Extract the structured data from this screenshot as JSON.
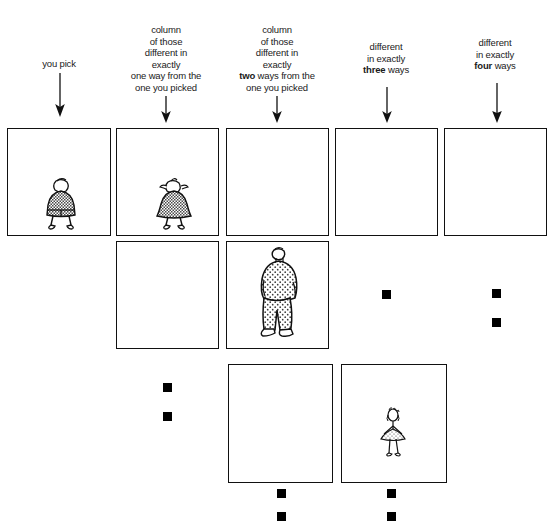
{
  "page": {
    "background_color": "#ffffff",
    "ink_color": "#111111",
    "marker_color": "#000000"
  },
  "columns": [
    {
      "id": "col-1",
      "index": 1,
      "caption_lines": [
        "you pick"
      ],
      "bold_word": "",
      "arrow": true
    },
    {
      "id": "col-2",
      "index": 2,
      "caption_lines": [
        "column",
        "of those",
        "different in",
        "exactly",
        "one way from the",
        "one you picked"
      ],
      "bold_word": "",
      "arrow": true
    },
    {
      "id": "col-3",
      "index": 3,
      "caption_lines": [
        "column",
        "of those",
        "different in",
        "exactly",
        "two ways from the",
        "one you picked"
      ],
      "bold_word": "two",
      "arrow": true
    },
    {
      "id": "col-4",
      "index": 4,
      "caption_lines": [
        "different",
        "in exactly",
        "three ways"
      ],
      "bold_word": "three",
      "arrow": true
    },
    {
      "id": "col-5",
      "index": 5,
      "caption_lines": [
        "different",
        "in exactly",
        "four ways"
      ],
      "bold_word": "four",
      "arrow": true
    }
  ],
  "grid": {
    "rows": [
      {
        "row": 1,
        "cells": [
          {
            "column": 1,
            "type": "box",
            "figure": "stout-figure-shorts",
            "markers": 0
          },
          {
            "column": 2,
            "type": "box",
            "figure": "stout-figure-skirt-pigtails",
            "markers": 0
          },
          {
            "column": 3,
            "type": "box",
            "figure": "",
            "markers": 0
          },
          {
            "column": 4,
            "type": "box",
            "figure": "",
            "markers": 0
          },
          {
            "column": 5,
            "type": "box",
            "figure": "",
            "markers": 0
          }
        ]
      },
      {
        "row": 2,
        "cells": [
          {
            "column": 1,
            "type": "empty",
            "figure": "",
            "markers": 0
          },
          {
            "column": 2,
            "type": "box",
            "figure": "",
            "markers": 0
          },
          {
            "column": 3,
            "type": "box",
            "figure": "tall-figure-stippled",
            "markers": 0
          },
          {
            "column": 4,
            "type": "markers",
            "figure": "",
            "markers": 1
          },
          {
            "column": 5,
            "type": "markers",
            "figure": "",
            "markers": 2
          }
        ]
      },
      {
        "row": 3,
        "cells": [
          {
            "column": 1,
            "type": "empty",
            "figure": "",
            "markers": 0
          },
          {
            "column": 2,
            "type": "markers",
            "figure": "",
            "markers": 2
          },
          {
            "column": 3,
            "type": "box",
            "figure": "",
            "markers": 0
          },
          {
            "column": 4,
            "type": "box",
            "figure": "thin-figure-skirt",
            "markers": 0
          },
          {
            "column": 5,
            "type": "empty",
            "figure": "",
            "markers": 0
          }
        ]
      },
      {
        "row": 4,
        "cells": [
          {
            "column": 1,
            "type": "empty",
            "figure": "",
            "markers": 0
          },
          {
            "column": 2,
            "type": "empty",
            "figure": "",
            "markers": 0
          },
          {
            "column": 3,
            "type": "markers",
            "figure": "",
            "markers": 2
          },
          {
            "column": 4,
            "type": "markers",
            "figure": "",
            "markers": 2
          },
          {
            "column": 5,
            "type": "empty",
            "figure": "",
            "markers": 0
          }
        ]
      }
    ]
  },
  "figures": {
    "stout-figure-shorts": {
      "label": "stout figure wearing shorts"
    },
    "stout-figure-skirt-pigtails": {
      "label": "stout figure with pigtails wearing a skirt"
    },
    "tall-figure-stippled": {
      "label": "tall heavy figure in stippled clothes"
    },
    "thin-figure-skirt": {
      "label": "thin small figure in a skirt"
    }
  }
}
